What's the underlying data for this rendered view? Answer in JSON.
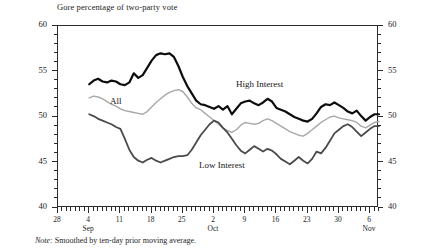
{
  "chart": {
    "title": "Gore percentage of two-party vote",
    "note_prefix": "Note:",
    "note_text": "Smoothed by ten-day prior moving average."
  },
  "series_labels": {
    "high": "High Interest",
    "all": "All",
    "low": "Low Interest"
  },
  "axis": {
    "y_ticks": [
      "40",
      "45",
      "50",
      "55",
      "60"
    ],
    "x_ticks": [
      "28",
      "4",
      "11",
      "18",
      "25",
      "2",
      "9",
      "16",
      "23",
      "30",
      "6"
    ],
    "months": [
      "Sep",
      "Oct",
      "Nov"
    ]
  },
  "colors": {
    "high": "#0d0d0d",
    "all": "#a8a8a8",
    "low": "#4a4a4a",
    "axis": "#2b2b2b",
    "text": "#1c1c1c"
  },
  "chart_data": {
    "type": "line",
    "title": "Gore percentage of two-party vote",
    "xlabel": "",
    "ylabel": "Gore percentage of two-party vote",
    "ylim": [
      40,
      60
    ],
    "xlim": [
      "Aug 28",
      "Nov 8"
    ],
    "grid": false,
    "legend": "inline-annotations",
    "annotations": [
      "High Interest",
      "All",
      "Low Interest"
    ],
    "note": "Smoothed by ten-day prior moving average.",
    "x_tick_labels": [
      "28",
      "4",
      "11",
      "18",
      "25",
      "2",
      "9",
      "16",
      "23",
      "30",
      "6"
    ],
    "x_tick_days": [
      0,
      7,
      14,
      21,
      28,
      35,
      42,
      49,
      56,
      63,
      70
    ],
    "x_month_markers": [
      {
        "label": "Sep",
        "day": 7
      },
      {
        "label": "Oct",
        "day": 35
      },
      {
        "label": "Nov",
        "day": 70
      }
    ],
    "x": [
      7,
      8,
      9,
      10,
      11,
      12,
      13,
      14,
      15,
      16,
      17,
      18,
      19,
      20,
      21,
      22,
      23,
      24,
      25,
      26,
      27,
      28,
      29,
      30,
      31,
      32,
      33,
      34,
      35,
      36,
      37,
      38,
      39,
      40,
      41,
      42,
      43,
      44,
      45,
      46,
      47,
      48,
      49,
      50,
      51,
      52,
      53,
      54,
      55,
      56,
      57,
      58,
      59,
      60,
      61,
      62,
      63,
      64,
      65,
      66,
      67,
      68,
      69,
      70,
      71,
      72
    ],
    "series": [
      {
        "name": "High Interest",
        "color": "#0d0d0d",
        "width": 2.2,
        "values": [
          53.6,
          54.0,
          54.2,
          53.9,
          53.8,
          54.0,
          53.9,
          53.6,
          53.5,
          53.8,
          54.8,
          54.3,
          54.6,
          55.4,
          56.2,
          56.8,
          57.0,
          56.9,
          57.0,
          56.6,
          55.6,
          54.4,
          53.4,
          52.6,
          51.8,
          51.4,
          51.3,
          51.1,
          50.9,
          51.2,
          50.8,
          51.2,
          50.3,
          50.9,
          51.5,
          51.7,
          51.8,
          51.5,
          51.3,
          51.6,
          52.0,
          51.7,
          51.0,
          50.8,
          50.6,
          50.3,
          50.0,
          49.8,
          49.6,
          49.5,
          49.8,
          50.4,
          51.1,
          51.4,
          51.3,
          51.6,
          51.3,
          51.0,
          50.6,
          50.4,
          50.7,
          50.1,
          49.6,
          50.0,
          50.3,
          50.3
        ]
      },
      {
        "name": "All",
        "color": "#a8a8a8",
        "width": 1.4,
        "values": [
          52.1,
          52.3,
          52.2,
          52.0,
          51.7,
          51.4,
          51.2,
          50.9,
          50.7,
          50.6,
          50.5,
          50.4,
          50.3,
          50.6,
          51.1,
          51.6,
          52.0,
          52.4,
          52.7,
          52.9,
          53.0,
          52.8,
          52.2,
          51.5,
          51.0,
          50.8,
          50.4,
          50.0,
          49.6,
          49.2,
          48.8,
          48.5,
          48.3,
          48.6,
          49.1,
          49.4,
          49.3,
          49.2,
          49.3,
          49.6,
          49.8,
          49.6,
          49.3,
          49.0,
          48.7,
          48.4,
          48.2,
          48.0,
          47.9,
          48.2,
          48.6,
          49.0,
          49.4,
          49.7,
          50.0,
          50.1,
          49.9,
          49.8,
          49.7,
          49.6,
          49.4,
          49.0,
          48.8,
          49.1,
          49.4,
          49.5
        ]
      },
      {
        "name": "Low Interest",
        "color": "#4a4a4a",
        "width": 1.8,
        "values": [
          50.3,
          50.1,
          49.8,
          49.6,
          49.4,
          49.2,
          48.9,
          48.7,
          47.6,
          46.4,
          45.6,
          45.2,
          45.0,
          45.3,
          45.5,
          45.2,
          45.0,
          45.2,
          45.4,
          45.6,
          45.7,
          45.7,
          45.8,
          46.4,
          47.2,
          48.0,
          48.6,
          49.2,
          49.6,
          49.4,
          48.8,
          48.3,
          47.6,
          46.9,
          46.3,
          46.0,
          46.4,
          46.8,
          46.5,
          46.2,
          46.5,
          46.3,
          45.9,
          45.4,
          45.1,
          44.8,
          45.2,
          45.6,
          45.2,
          44.9,
          45.4,
          46.2,
          46.0,
          46.6,
          47.4,
          48.2,
          48.6,
          49.0,
          49.2,
          48.9,
          48.4,
          47.9,
          48.3,
          48.7,
          49.0,
          49.0
        ]
      }
    ]
  }
}
